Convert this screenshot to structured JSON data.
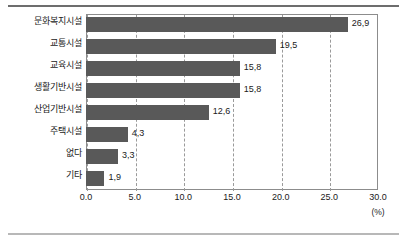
{
  "chart_data": {
    "type": "bar",
    "orientation": "horizontal",
    "title": "",
    "xlabel": "(%)",
    "ylabel": "",
    "xlim": [
      0.0,
      30.0
    ],
    "xticks": [
      "0.0",
      "5.0",
      "10.0",
      "15.0",
      "20.0",
      "25.0",
      "30.0"
    ],
    "xtick_values": [
      0,
      5,
      10,
      15,
      20,
      25,
      30
    ],
    "grid": "vertical-dashed",
    "legend": "none",
    "bar_color": "#595959",
    "categories": [
      "문화복지시설",
      "교통시설",
      "교육시설",
      "생활기반시설",
      "산업기반시설",
      "주택시설",
      "없다",
      "기타"
    ],
    "values": [
      26.9,
      19.5,
      15.8,
      15.8,
      12.6,
      4.3,
      3.3,
      1.9
    ],
    "value_labels": [
      "26,9",
      "19,5",
      "15,8",
      "15,8",
      "12,6",
      "4,3",
      "3,3",
      "1,9"
    ]
  },
  "axis": {
    "unit": "(%)"
  }
}
